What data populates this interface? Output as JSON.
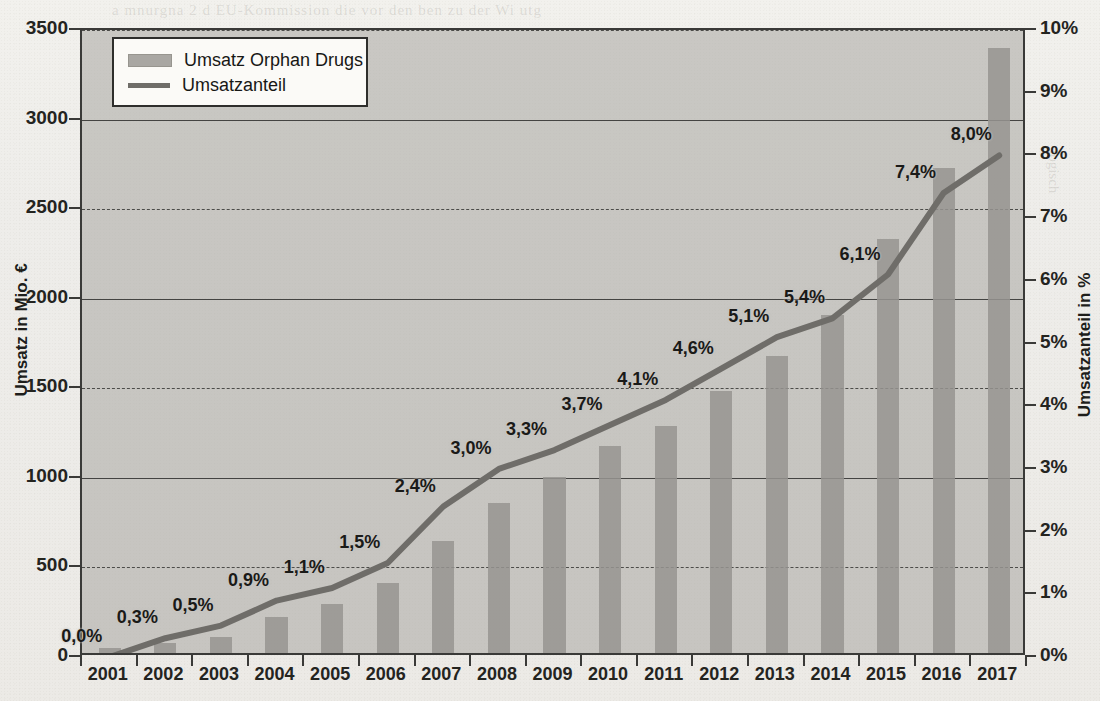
{
  "chart_data": {
    "type": "bar",
    "title": "",
    "subtitle": "",
    "xlabel": "",
    "ylabel": "Umsatz in Mio. €",
    "ylabel_right": "Umsatzanteil in %",
    "grid": true,
    "legend_position": "top-left",
    "categories": [
      "2001",
      "2002",
      "2003",
      "2004",
      "2005",
      "2006",
      "2007",
      "2008",
      "2009",
      "2010",
      "2011",
      "2012",
      "2013",
      "2014",
      "2015",
      "2016",
      "2017"
    ],
    "ylim": [
      0,
      3500
    ],
    "ylim_right": [
      0,
      10
    ],
    "yticks": [
      "0",
      "500",
      "1000",
      "1500",
      "2000",
      "2500",
      "3000",
      "3500"
    ],
    "yticks_right": [
      "0%",
      "1%",
      "2%",
      "3%",
      "4%",
      "5%",
      "6%",
      "7%",
      "8%",
      "9%",
      "10%"
    ],
    "series": [
      {
        "name": "Umsatz Orphan Drugs",
        "type": "bar",
        "axis": "left",
        "unit": "Mio. €",
        "color": "#96948f",
        "values": [
          30,
          55,
          90,
          200,
          275,
          390,
          625,
          840,
          985,
          1155,
          1270,
          1465,
          1660,
          1885,
          2310,
          2705,
          3380
        ]
      },
      {
        "name": "Umsatzanteil",
        "type": "line",
        "axis": "right",
        "unit": "%",
        "color": "#6f6d69",
        "values": [
          0.0,
          0.3,
          0.5,
          0.9,
          1.1,
          1.5,
          2.4,
          3.0,
          3.3,
          3.7,
          4.1,
          4.6,
          5.1,
          5.4,
          6.1,
          7.4,
          8.0
        ],
        "point_labels": [
          "0,0%",
          "0,3%",
          "0,5%",
          "0,9%",
          "1,1%",
          "1,5%",
          "2,4%",
          "3,0%",
          "3,3%",
          "3,7%",
          "4,1%",
          "4,6%",
          "5,1%",
          "5,4%",
          "6,1%",
          "7,4%",
          "8,0%"
        ]
      }
    ]
  },
  "legend": {
    "items": [
      {
        "label": "Umsatz Orphan Drugs",
        "marker": "bar-swatch"
      },
      {
        "label": "Umsatzanteil",
        "marker": "line-swatch"
      }
    ]
  },
  "axes": {
    "left_title": "Umsatz in Mio. €",
    "right_title": "Umsatzanteil in %"
  }
}
